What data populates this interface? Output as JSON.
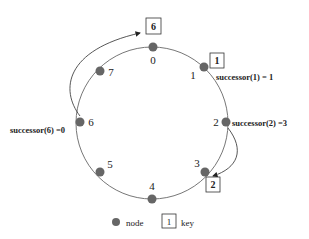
{
  "diagram": {
    "type": "chord-ring",
    "ring": {
      "cx": 152,
      "cy": 123,
      "r": 76,
      "stroke": "#777777"
    },
    "node_color": "#666666",
    "nodes": [
      {
        "id": "0",
        "x": 153,
        "y": 47,
        "lx": 153,
        "ly": 64,
        "anchor": "middle"
      },
      {
        "id": "1",
        "x": 204,
        "y": 67,
        "lx": 193,
        "ly": 79,
        "anchor": "middle"
      },
      {
        "id": "2",
        "x": 226,
        "y": 122,
        "lx": 216,
        "ly": 126,
        "anchor": "middle"
      },
      {
        "id": "3",
        "x": 205,
        "y": 172,
        "lx": 197,
        "ly": 167,
        "anchor": "middle"
      },
      {
        "id": "4",
        "x": 152,
        "y": 199,
        "lx": 152,
        "ly": 190,
        "anchor": "middle"
      },
      {
        "id": "5",
        "x": 100,
        "y": 172,
        "lx": 110,
        "ly": 168,
        "anchor": "middle"
      },
      {
        "id": "6",
        "x": 80,
        "y": 122,
        "lx": 91,
        "ly": 126,
        "anchor": "middle"
      },
      {
        "id": "7",
        "x": 100,
        "y": 71,
        "lx": 111,
        "ly": 76,
        "anchor": "middle"
      }
    ],
    "keys": [
      {
        "id": "6",
        "x": 146,
        "y": 18,
        "w": 15,
        "h": 16
      },
      {
        "id": "1",
        "x": 210,
        "y": 53,
        "w": 14,
        "h": 15
      },
      {
        "id": "2",
        "x": 206,
        "y": 177,
        "w": 14,
        "h": 15
      }
    ],
    "annotations": [
      {
        "text": "successor(1) = 1",
        "x": 216,
        "y": 80
      },
      {
        "text": "successor(2) =3",
        "x": 232,
        "y": 126
      },
      {
        "text": "successor(6) =0",
        "x": 10,
        "y": 133
      }
    ],
    "legend": {
      "node_label": "node",
      "key_sample": "1",
      "key_label": "key"
    }
  }
}
